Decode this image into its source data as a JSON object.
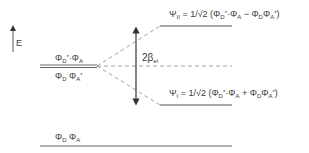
{
  "diagram": {
    "type": "energy-level-diagram",
    "axis": {
      "label": "E",
      "direction": "up"
    },
    "levels": [
      {
        "id": "psi-II",
        "label": "ΨII = 1/√2 (ΦD*·ΦA − ΦDΦA*)",
        "position": "upper-right"
      },
      {
        "id": "degenerate",
        "label_top": "ΦD*·ΦA",
        "label_bottom": "ΦD ΦA*",
        "position": "left-middle",
        "style": "double-line"
      },
      {
        "id": "reference",
        "style": "dashed",
        "position": "right-middle"
      },
      {
        "id": "psi-I",
        "label": "ΨI = 1/√2 (ΦD*·ΦA + ΦDΦA*)",
        "position": "lower-right"
      },
      {
        "id": "ground",
        "label": "ΦD ΦA",
        "position": "bottom"
      }
    ],
    "splitting": {
      "label": "2βel",
      "arrow": "double-headed"
    }
  },
  "labels": {
    "energy": "E",
    "psi2": {
      "psi": "Ψ",
      "sub": "II",
      "eq": " = 1/",
      "sqrt": "√2",
      "open": " (Φ",
      "t1sub": "D",
      "t1sup": "*",
      "dot": "·Φ",
      "t2sub": "A",
      "op": " − Φ",
      "t3sub": "D",
      "phi": "Φ",
      "t4sub": "A",
      "t4sup": "*",
      "close": ")"
    },
    "psi1": {
      "psi": "Ψ",
      "sub": "I",
      "eq": " = 1/",
      "sqrt": "√2",
      "open": " (Φ",
      "t1sub": "D",
      "t1sup": "*",
      "dot": "·Φ",
      "t2sub": "A",
      "op": " + Φ",
      "t3sub": "D",
      "phi": "Φ",
      "t4sub": "A",
      "t4sup": "*",
      "close": ")"
    },
    "degen_top": {
      "phi1": "Φ",
      "sub1": "D",
      "sup1": "*",
      "dot": "·Φ",
      "sub2": "A"
    },
    "degen_bottom": {
      "phi1": "Φ",
      "sub1": "D",
      "phi2": " Φ",
      "sub2": "A",
      "sup2": "*"
    },
    "ground": {
      "phi1": "Φ",
      "sub1": "D",
      "phi2": " Φ",
      "sub2": "A"
    },
    "beta": {
      "two": "2",
      "beta": "β",
      "sub": "el"
    }
  },
  "colors": {
    "line": "#4a4a4a",
    "dashed": "#8a8a8a",
    "text": "#3a3a3a"
  }
}
